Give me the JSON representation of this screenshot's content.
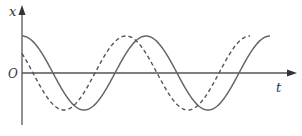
{
  "diagram": {
    "title": "",
    "axes": {
      "y_label": "x",
      "x_label": "t",
      "origin_label": "O"
    },
    "curves": [
      {
        "name": "solid-wave",
        "style": "solid",
        "shape": "cosine starting at maximum",
        "color": "#666666"
      },
      {
        "name": "dashed-wave",
        "style": "dashed",
        "shape": "sinusoid leading solid wave by about 1/6 period",
        "color": "#555555"
      }
    ]
  }
}
